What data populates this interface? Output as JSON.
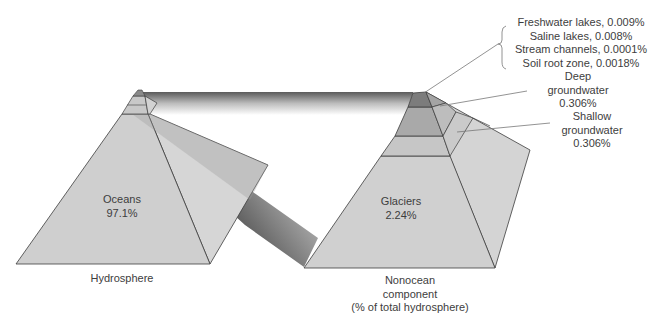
{
  "diagram": {
    "type": "pyramid-comparison",
    "left_pyramid": {
      "caption": "Hydrosphere",
      "segments": [
        {
          "name": "Oceans",
          "value": "97.1%"
        }
      ]
    },
    "right_pyramid": {
      "caption_lines": [
        "Nonocean",
        "component",
        "(% of total hydrosphere)"
      ],
      "segments": [
        {
          "name": "Glaciers",
          "value": "2.24%"
        }
      ]
    },
    "callouts": {
      "bracket_group": [
        "Freshwater lakes, 0.009%",
        "Saline lakes, 0.008%",
        "Stream channels, 0.0001%",
        "Soil root zone, 0.0018%"
      ],
      "deep_groundwater": [
        "Deep",
        "groundwater",
        "0.306%"
      ],
      "shallow_groundwater": [
        "Shallow",
        "groundwater",
        "0.306%"
      ]
    },
    "colors": {
      "face_light": "#d3d3d3",
      "face_mid": "#c2c2c2",
      "face_dark": "#9e9e9e",
      "face_top": "#7a7a7a",
      "edge": "#3c3c3c",
      "leader": "#777777"
    }
  }
}
